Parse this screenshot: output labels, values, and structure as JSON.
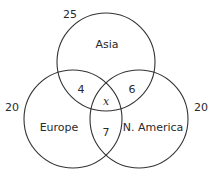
{
  "diagram": {
    "type": "venn",
    "sets": [
      {
        "id": "asia",
        "label": "Asia",
        "total": "25",
        "cx": 106,
        "cy": 62,
        "r": 49
      },
      {
        "id": "europe",
        "label": "Europe",
        "total": "20",
        "cx": 73,
        "cy": 119,
        "r": 49
      },
      {
        "id": "namerica",
        "label": "N. America",
        "total": "20",
        "cx": 139,
        "cy": 119,
        "r": 49
      }
    ],
    "regions": {
      "asia_europe": "4",
      "asia_namerica": "6",
      "europe_namerica": "7",
      "all_three": "x"
    },
    "stroke_color": "#333333",
    "text_color": "#2a2a2a"
  }
}
